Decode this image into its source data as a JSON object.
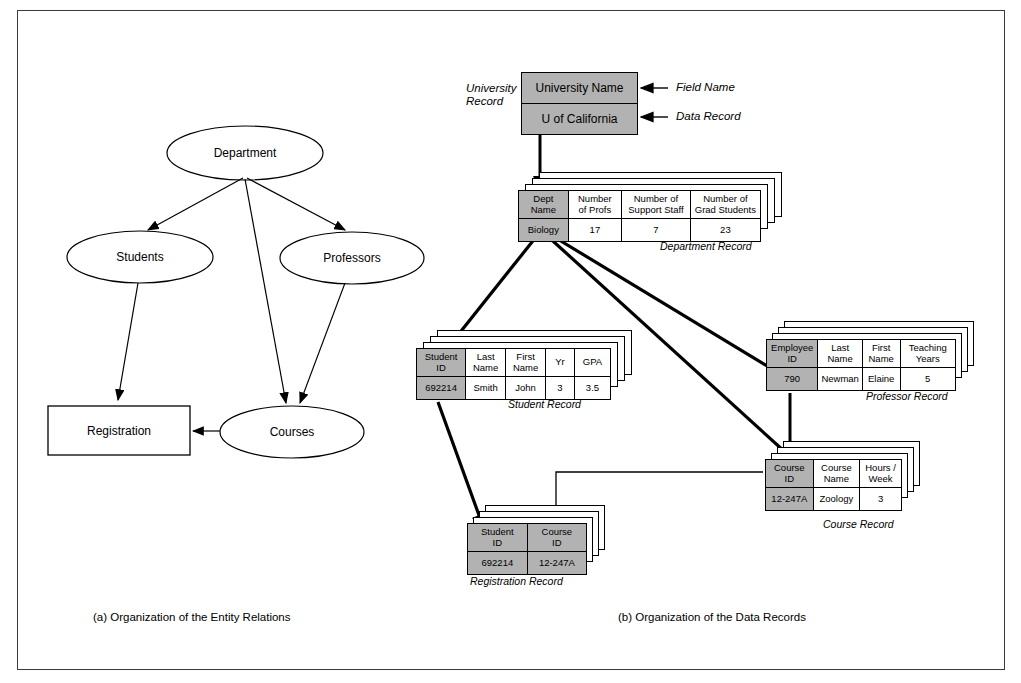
{
  "figure": {
    "caption_a": "(a)  Organization of the Entity Relations",
    "caption_b": "(b) Organization of the Data Records"
  },
  "er_diagram": {
    "nodes": [
      {
        "id": "department",
        "label": "Department",
        "shape": "ellipse"
      },
      {
        "id": "students",
        "label": "Students",
        "shape": "ellipse"
      },
      {
        "id": "professors",
        "label": "Professors",
        "shape": "ellipse"
      },
      {
        "id": "courses",
        "label": "Courses",
        "shape": "ellipse"
      },
      {
        "id": "registration",
        "label": "Registration",
        "shape": "rectangle"
      }
    ],
    "edges": [
      {
        "from": "department",
        "to": "students"
      },
      {
        "from": "department",
        "to": "professors"
      },
      {
        "from": "department",
        "to": "courses"
      },
      {
        "from": "professors",
        "to": "courses"
      },
      {
        "from": "students",
        "to": "registration"
      },
      {
        "from": "courses",
        "to": "registration"
      }
    ]
  },
  "data_records": {
    "annotations": {
      "university_record": "University\nRecord",
      "university_record_line1": "University",
      "university_record_line2": "Record",
      "field_name": "Field Name",
      "data_record": "Data Record"
    },
    "university": {
      "label": "",
      "field_name_value": "University Name",
      "data_record_value": "U of California"
    },
    "department": {
      "label": "Department Record",
      "headers": [
        "Dept Name",
        "Number of Profs",
        "Number of Support Staff",
        "Number of Grad Students"
      ],
      "headers_wrapped": [
        [
          "Dept",
          "Name"
        ],
        [
          "Number",
          "of Profs"
        ],
        [
          "Number of",
          "Support Staff"
        ],
        [
          "Number of",
          "Grad Students"
        ]
      ],
      "values": [
        "Biology",
        "17",
        "7",
        "23"
      ],
      "key_column": 0,
      "stack_count": 4
    },
    "student": {
      "label": "Student Record",
      "headers": [
        "Student ID",
        "Last Name",
        "First Name",
        "Yr",
        "GPA"
      ],
      "headers_wrapped": [
        [
          "Student",
          "ID"
        ],
        [
          "Last",
          "Name"
        ],
        [
          "First",
          "Name"
        ],
        [
          "Yr",
          ""
        ],
        [
          "GPA",
          ""
        ]
      ],
      "values": [
        "692214",
        "Smith",
        "John",
        "3",
        "3.5"
      ],
      "key_column": 0,
      "stack_count": 4
    },
    "professor": {
      "label": "Professor Record",
      "headers": [
        "Employee ID",
        "Last Name",
        "First Name",
        "Teaching Years"
      ],
      "headers_wrapped": [
        [
          "Employee",
          "ID"
        ],
        [
          "Last",
          "Name"
        ],
        [
          "First",
          "Name"
        ],
        [
          "Teaching",
          "Years"
        ]
      ],
      "values": [
        "790",
        "Newman",
        "Elaine",
        "5"
      ],
      "key_column": 0,
      "stack_count": 4
    },
    "course": {
      "label": "Course Record",
      "headers": [
        "Course ID",
        "Course Name",
        "Hours / Week"
      ],
      "headers_wrapped": [
        [
          "Course",
          "ID"
        ],
        [
          "Course",
          "Name"
        ],
        [
          "Hours /",
          "Week"
        ]
      ],
      "values": [
        "12-247A",
        "Zoology",
        "3"
      ],
      "key_column": 0,
      "stack_count": 4
    },
    "registration": {
      "label": "Registration Record",
      "headers": [
        "Student ID",
        "Course ID"
      ],
      "headers_wrapped": [
        [
          "Student",
          "ID"
        ],
        [
          "Course",
          "ID"
        ]
      ],
      "values": [
        "692214",
        "12-247A"
      ],
      "key_column": -1,
      "all_keys": true,
      "stack_count": 4
    }
  },
  "colors": {
    "key_fill": "#b2b2b2",
    "line": "#000000",
    "frame": "#3a3a3a",
    "background": "#ffffff"
  }
}
